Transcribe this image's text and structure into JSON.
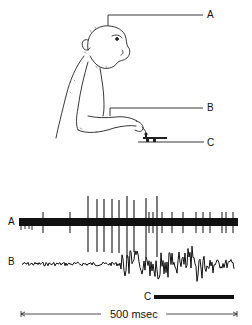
{
  "figure": {
    "labels": {
      "a_top": "A",
      "b_top": "B",
      "c_top": "C",
      "a_trace": "A",
      "b_trace": "B",
      "c_bar": "C",
      "scale": "500 msec"
    }
  },
  "traces": {
    "A": {
      "type": "spike train",
      "large_spike_x": [
        88,
        97,
        104,
        112,
        119,
        127,
        134,
        146,
        157
      ],
      "small_spike_x": [
        43,
        70,
        149,
        153,
        162,
        172,
        183,
        196,
        203,
        210,
        222,
        226,
        233
      ]
    },
    "B": {
      "type": "EMG",
      "onset_x": 120
    },
    "C": {
      "type": "key-press bar",
      "start_x": 154,
      "end_x": 234
    }
  },
  "scale_bar": {
    "label": "500 msec",
    "start_x": 21,
    "end_x": 237
  }
}
